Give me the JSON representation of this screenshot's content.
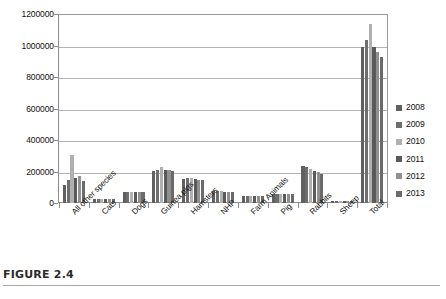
{
  "caption": {
    "label": "FIGURE 2.4"
  },
  "legend": {
    "position": "right",
    "entries": [
      {
        "label": "2008",
        "color": "#606060"
      },
      {
        "label": "2009",
        "color": "#6e6e6e"
      },
      {
        "label": "2010",
        "color": "#b0b0b0"
      },
      {
        "label": "2011",
        "color": "#5a5a5a"
      },
      {
        "label": "2012",
        "color": "#909090"
      },
      {
        "label": "2013",
        "color": "#6a6a6a"
      }
    ]
  },
  "axes": {
    "y_ticks": [
      "0",
      "200000",
      "400000",
      "600000",
      "800000",
      "1000000",
      "1200000"
    ],
    "x_categories": [
      "All other species",
      "Cats",
      "Dogs",
      "Guinea pigs",
      "Hamsters",
      "NHP",
      "Farm Animals",
      "Pig",
      "Rabbits",
      "Sheep",
      "Total"
    ]
  },
  "chart_data": {
    "type": "bar",
    "title": "",
    "xlabel": "",
    "ylabel": "",
    "ylim": [
      0,
      1200000
    ],
    "ytick_interval": 200000,
    "grid": true,
    "legend_position": "right",
    "categories": [
      "All other species",
      "Cats",
      "Dogs",
      "Guinea pigs",
      "Hamsters",
      "NHP",
      "Farm Animals",
      "Pig",
      "Rabbits",
      "Sheep",
      "Total"
    ],
    "series": [
      {
        "name": "2008",
        "color": "#606060",
        "values": [
          112000,
          24000,
          70000,
          206000,
          152000,
          74000,
          46000,
          58000,
          236000,
          13000,
          991000
        ]
      },
      {
        "name": "2009",
        "color": "#6e6e6e",
        "values": [
          143000,
          25000,
          72000,
          212000,
          156000,
          76000,
          47000,
          60000,
          228000,
          13000,
          1032000
        ]
      },
      {
        "name": "2010",
        "color": "#b0b0b0",
        "values": [
          305000,
          26000,
          71000,
          228000,
          158000,
          75000,
          46000,
          59000,
          215000,
          12000,
          1137000
        ]
      },
      {
        "name": "2011",
        "color": "#5a5a5a",
        "values": [
          162000,
          25000,
          67000,
          209000,
          150000,
          71000,
          44000,
          57000,
          203000,
          12000,
          988000
        ]
      },
      {
        "name": "2012",
        "color": "#909090",
        "values": [
          172000,
          24000,
          68000,
          207000,
          147000,
          69000,
          43000,
          56000,
          194000,
          11000,
          961000
        ]
      },
      {
        "name": "2013",
        "color": "#6a6a6a",
        "values": [
          138000,
          24000,
          69000,
          204000,
          144000,
          68000,
          42000,
          55000,
          182000,
          11000,
          928000
        ]
      }
    ]
  }
}
